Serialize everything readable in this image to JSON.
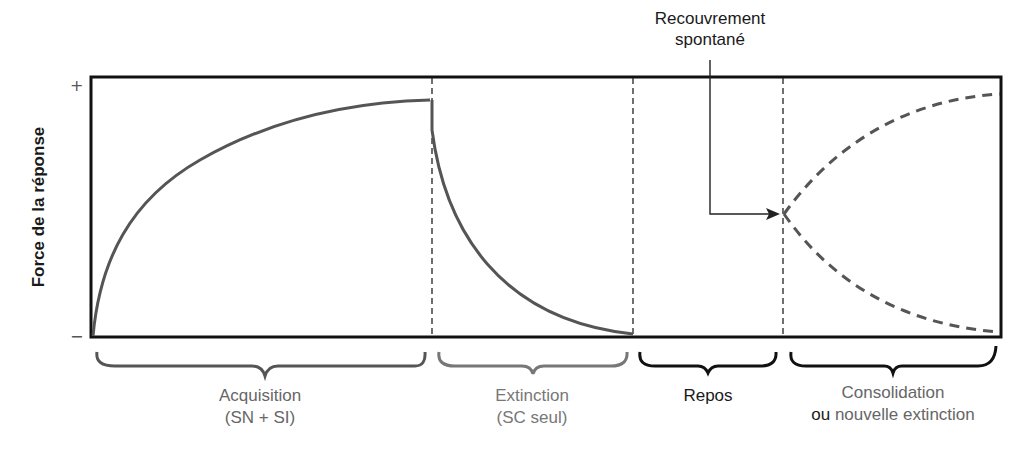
{
  "diagram": {
    "y_axis": {
      "label": "Force de la réponse",
      "top_tick": "+",
      "bottom_tick": "−"
    },
    "annotation": {
      "line1": "Recouvrement",
      "line2": "spontané"
    },
    "phases": [
      {
        "id": "acquisition",
        "label_line1": "Acquisition",
        "label_line2": "(SN + SI)",
        "brace_color": "#555555",
        "text_color": "#666666"
      },
      {
        "id": "extinction",
        "label_line1": "Extinction",
        "label_line2": "(SC seul)",
        "brace_color": "#777777",
        "text_color": "#777777"
      },
      {
        "id": "repos",
        "label_line1": "Repos",
        "label_line2": "",
        "brace_color": "#111111",
        "text_color": "#1a1a1a"
      },
      {
        "id": "consolidation",
        "label_line1": "Consolidation",
        "label_line2_prefix": "ou",
        "label_line2_rest": " nouvelle extinction",
        "brace_color": "#111111",
        "text_color": "#666666"
      }
    ],
    "colors": {
      "frame": "#111111",
      "curve": "#555555",
      "divider": "#222222",
      "dashed_curve": "#555555"
    }
  }
}
